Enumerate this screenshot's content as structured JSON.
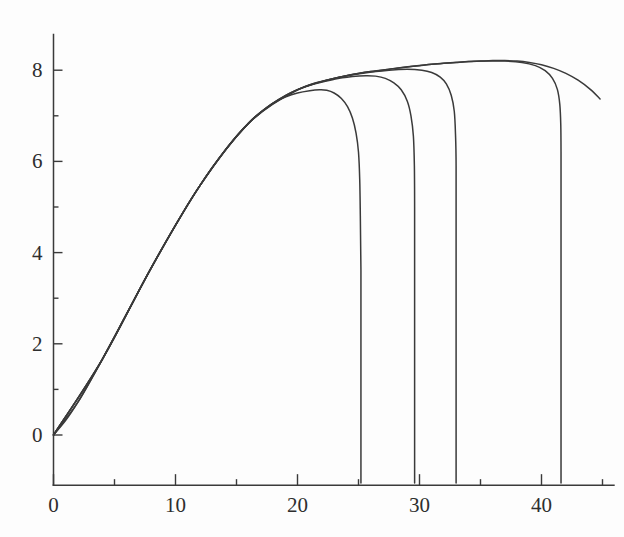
{
  "figure": {
    "title": "",
    "background_color": "#fdfdfd",
    "line_color": "#3a3a3a",
    "axis_color": "#3a3a3a",
    "label_color": "#2e2e2e"
  },
  "chart_data": {
    "type": "line",
    "title": "",
    "subtitle": "",
    "xlabel": "",
    "ylabel": "",
    "xlim": [
      0,
      46
    ],
    "ylim": [
      -1.1,
      8.8
    ],
    "grid": false,
    "legend": "none",
    "annotations": [],
    "x_ticks": [
      0,
      10,
      20,
      30,
      40
    ],
    "x_tick_labels": [
      "0",
      "10",
      "20",
      "30",
      "40"
    ],
    "x_minor_ticks": [
      5,
      15,
      25,
      35,
      45
    ],
    "y_ticks": [
      0,
      2,
      4,
      6,
      8
    ],
    "y_tick_labels": [
      "0",
      "2",
      "4",
      "6",
      "8"
    ],
    "y_minor_ticks": [
      1,
      3,
      5,
      7
    ],
    "series": [
      {
        "name": "envelope",
        "points": [
          [
            0.0,
            0.0
          ],
          [
            1.0,
            0.32
          ],
          [
            2.0,
            0.72
          ],
          [
            3.0,
            1.18
          ],
          [
            4.0,
            1.66
          ],
          [
            5.0,
            2.16
          ],
          [
            6.0,
            2.66
          ],
          [
            7.0,
            3.16
          ],
          [
            8.0,
            3.66
          ],
          [
            9.0,
            4.14
          ],
          [
            10.0,
            4.6
          ],
          [
            11.0,
            5.05
          ],
          [
            12.0,
            5.47
          ],
          [
            13.0,
            5.86
          ],
          [
            14.0,
            6.22
          ],
          [
            15.0,
            6.55
          ],
          [
            16.0,
            6.84
          ],
          [
            17.0,
            7.08
          ],
          [
            18.0,
            7.28
          ],
          [
            19.0,
            7.44
          ],
          [
            20.0,
            7.57
          ],
          [
            21.0,
            7.67
          ],
          [
            22.0,
            7.75
          ],
          [
            23.0,
            7.82
          ],
          [
            24.0,
            7.88
          ],
          [
            25.0,
            7.93
          ],
          [
            26.0,
            7.97
          ],
          [
            27.0,
            8.0
          ],
          [
            28.0,
            8.04
          ],
          [
            29.0,
            8.07
          ],
          [
            30.0,
            8.1
          ],
          [
            31.0,
            8.13
          ],
          [
            32.0,
            8.15
          ],
          [
            33.0,
            8.17
          ],
          [
            34.0,
            8.19
          ],
          [
            35.0,
            8.2
          ],
          [
            36.0,
            8.21
          ],
          [
            37.0,
            8.21
          ],
          [
            38.0,
            8.2
          ],
          [
            39.0,
            8.17
          ],
          [
            40.0,
            8.12
          ],
          [
            41.0,
            8.04
          ],
          [
            42.0,
            7.93
          ],
          [
            43.0,
            7.78
          ],
          [
            44.0,
            7.58
          ],
          [
            44.8,
            7.37
          ]
        ]
      },
      {
        "name": "branch-1",
        "drop_x": 25.2,
        "points": [
          [
            0.0,
            0.0
          ],
          [
            2.0,
            0.72
          ],
          [
            4.0,
            1.66
          ],
          [
            6.0,
            2.66
          ],
          [
            8.0,
            3.66
          ],
          [
            10.0,
            4.6
          ],
          [
            12.0,
            5.47
          ],
          [
            14.0,
            6.22
          ],
          [
            16.0,
            6.84
          ],
          [
            17.0,
            7.08
          ],
          [
            18.0,
            7.28
          ],
          [
            19.0,
            7.41
          ],
          [
            20.0,
            7.5
          ],
          [
            21.0,
            7.55
          ],
          [
            21.8,
            7.57
          ],
          [
            22.4,
            7.56
          ],
          [
            23.0,
            7.5
          ],
          [
            23.6,
            7.38
          ],
          [
            24.1,
            7.2
          ],
          [
            24.5,
            6.95
          ],
          [
            24.8,
            6.62
          ],
          [
            25.0,
            6.2
          ],
          [
            25.1,
            5.6
          ],
          [
            25.15,
            4.8
          ],
          [
            25.2,
            3.6
          ],
          [
            25.2,
            1.6
          ],
          [
            25.2,
            -1.05
          ]
        ]
      },
      {
        "name": "branch-2",
        "drop_x": 29.6,
        "points": [
          [
            0.0,
            0.0
          ],
          [
            4.0,
            1.66
          ],
          [
            8.0,
            3.66
          ],
          [
            12.0,
            5.47
          ],
          [
            16.0,
            6.84
          ],
          [
            19.0,
            7.44
          ],
          [
            21.0,
            7.67
          ],
          [
            23.0,
            7.8
          ],
          [
            24.5,
            7.86
          ],
          [
            25.6,
            7.88
          ],
          [
            26.4,
            7.87
          ],
          [
            27.2,
            7.82
          ],
          [
            27.9,
            7.72
          ],
          [
            28.5,
            7.57
          ],
          [
            29.0,
            7.32
          ],
          [
            29.3,
            7.0
          ],
          [
            29.5,
            6.55
          ],
          [
            29.58,
            5.9
          ],
          [
            29.6,
            5.0
          ],
          [
            29.6,
            3.2
          ],
          [
            29.6,
            0.8
          ],
          [
            29.6,
            -1.05
          ]
        ]
      },
      {
        "name": "branch-3",
        "drop_x": 33.0,
        "points": [
          [
            0.0,
            0.0
          ],
          [
            4.0,
            1.66
          ],
          [
            8.0,
            3.66
          ],
          [
            12.0,
            5.47
          ],
          [
            16.0,
            6.84
          ],
          [
            20.0,
            7.57
          ],
          [
            23.0,
            7.82
          ],
          [
            25.5,
            7.94
          ],
          [
            27.5,
            8.0
          ],
          [
            29.0,
            8.02
          ],
          [
            30.2,
            8.0
          ],
          [
            31.0,
            7.95
          ],
          [
            31.7,
            7.85
          ],
          [
            32.2,
            7.7
          ],
          [
            32.6,
            7.45
          ],
          [
            32.85,
            7.1
          ],
          [
            32.95,
            6.6
          ],
          [
            33.0,
            5.9
          ],
          [
            33.0,
            4.0
          ],
          [
            33.0,
            1.2
          ],
          [
            33.0,
            -1.05
          ]
        ]
      },
      {
        "name": "branch-4",
        "drop_x": 41.6,
        "points": [
          [
            0.0,
            0.0
          ],
          [
            4.0,
            1.66
          ],
          [
            8.0,
            3.66
          ],
          [
            12.0,
            5.47
          ],
          [
            16.0,
            6.84
          ],
          [
            20.0,
            7.57
          ],
          [
            24.0,
            7.88
          ],
          [
            28.0,
            8.04
          ],
          [
            31.0,
            8.13
          ],
          [
            33.5,
            8.18
          ],
          [
            35.5,
            8.2
          ],
          [
            37.0,
            8.2
          ],
          [
            38.4,
            8.17
          ],
          [
            39.5,
            8.1
          ],
          [
            40.3,
            7.99
          ],
          [
            40.9,
            7.82
          ],
          [
            41.3,
            7.58
          ],
          [
            41.5,
            7.25
          ],
          [
            41.58,
            6.8
          ],
          [
            41.6,
            6.2
          ],
          [
            41.6,
            4.4
          ],
          [
            41.6,
            1.5
          ],
          [
            41.6,
            -1.05
          ]
        ]
      }
    ]
  }
}
